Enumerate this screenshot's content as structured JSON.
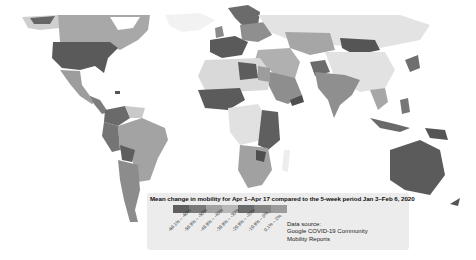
{
  "map": {
    "type": "choropleth",
    "region": "World",
    "metric": "Mean change in mobility"
  },
  "legend": {
    "title": "Mean change in mobility for Apr 1–Apr 17 compared to the 5-week period Jan 3–Feb 6, 2020",
    "bins": [
      {
        "label": "-69.1% – -60%",
        "color": "#5f5f5f"
      },
      {
        "label": "-59.9% – -50%",
        "color": "#7a7a7a"
      },
      {
        "label": "-49.9% – -40%",
        "color": "#a2a2a2"
      },
      {
        "label": "-39.9% – -30%",
        "color": "#b8b8b8"
      },
      {
        "label": "-29.9% – -20%",
        "color": "#6c6c6c"
      },
      {
        "label": "-19.9% – 0%",
        "color": "#858585"
      },
      {
        "label": "0.1% – 2%",
        "color": "#9c9c9c"
      }
    ]
  },
  "source": {
    "line1": "Data source:",
    "line2": "Google COVID-19 Community",
    "line3": "Mobility Reports"
  }
}
